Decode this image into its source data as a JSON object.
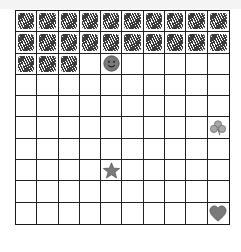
{
  "grid": {
    "rows": 10,
    "cols": 10,
    "shaded_cells": [
      [
        0,
        0
      ],
      [
        0,
        1
      ],
      [
        0,
        2
      ],
      [
        0,
        3
      ],
      [
        0,
        4
      ],
      [
        0,
        5
      ],
      [
        0,
        6
      ],
      [
        0,
        7
      ],
      [
        0,
        8
      ],
      [
        0,
        9
      ],
      [
        1,
        0
      ],
      [
        1,
        1
      ],
      [
        1,
        2
      ],
      [
        1,
        3
      ],
      [
        1,
        4
      ],
      [
        1,
        5
      ],
      [
        1,
        6
      ],
      [
        1,
        7
      ],
      [
        1,
        8
      ],
      [
        1,
        9
      ],
      [
        2,
        0
      ],
      [
        2,
        1
      ],
      [
        2,
        2
      ]
    ],
    "tokens": [
      {
        "type": "smiley",
        "name": "smiley-face-icon",
        "row": 2,
        "col": 4
      },
      {
        "type": "clover",
        "name": "clover-icon",
        "row": 5,
        "col": 9
      },
      {
        "type": "star",
        "name": "star-icon",
        "row": 7,
        "col": 4
      },
      {
        "type": "heart",
        "name": "heart-icon",
        "row": 9,
        "col": 9
      }
    ]
  },
  "colors": {
    "grid_line": "#222222",
    "shading": "#2a2a2a",
    "token_fill": "#7a7a7a",
    "token_stroke": "#4a4a4a",
    "clover_fill": "#a8a8a8"
  }
}
